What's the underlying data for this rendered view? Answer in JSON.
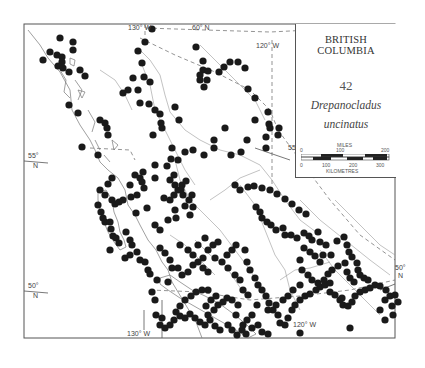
{
  "legend": {
    "region": "BRITISH COLUMBIA",
    "map_number": "42",
    "species_line1": "Drepanocladus",
    "species_line2": "uncinatus"
  },
  "scale_bar": {
    "miles_label": "MILES",
    "miles_ticks": [
      "0",
      "100",
      "200"
    ],
    "km_label": "KILOMETRES",
    "km_ticks": [
      "0",
      "100",
      "200",
      "300"
    ]
  },
  "graticule": {
    "lon_130_top": "130° W",
    "lat_60": "60° N",
    "lon_120_top": "120° W",
    "lat_55_left": "55°",
    "lat_55_left_n": "N",
    "lat_55_right": "55°",
    "lat_55_right_n": "N",
    "lat_50_left": "50°",
    "lat_50_left_n": "N",
    "lat_50_right": "50°",
    "lat_50_right_n": "N",
    "lon_130_bottom": "130° W",
    "lon_120_bottom": "120° W"
  },
  "colors": {
    "dot": "#1a1a1a",
    "line": "#777777",
    "background": "#ffffff"
  },
  "occurrence_points": [
    [
      60,
      38
    ],
    [
      73,
      42
    ],
    [
      73,
      50
    ],
    [
      50,
      52
    ],
    [
      43,
      60
    ],
    [
      57,
      55
    ],
    [
      62,
      57
    ],
    [
      62,
      62
    ],
    [
      58,
      66
    ],
    [
      63,
      68
    ],
    [
      69,
      72
    ],
    [
      80,
      70
    ],
    [
      85,
      76
    ],
    [
      69,
      105
    ],
    [
      78,
      113
    ],
    [
      100,
      120
    ],
    [
      105,
      123
    ],
    [
      107,
      128
    ],
    [
      108,
      135
    ],
    [
      82,
      147
    ],
    [
      98,
      155
    ],
    [
      152,
      29
    ],
    [
      145,
      42
    ],
    [
      138,
      51
    ],
    [
      142,
      63
    ],
    [
      133,
      78
    ],
    [
      144,
      77
    ],
    [
      150,
      82
    ],
    [
      128,
      90
    ],
    [
      138,
      90
    ],
    [
      123,
      93
    ],
    [
      140,
      103
    ],
    [
      149,
      104
    ],
    [
      155,
      110
    ],
    [
      160,
      114
    ],
    [
      161,
      123
    ],
    [
      175,
      107
    ],
    [
      179,
      120
    ],
    [
      162,
      128
    ],
    [
      153,
      135
    ],
    [
      172,
      148
    ],
    [
      171,
      159
    ],
    [
      196,
      47
    ],
    [
      203,
      61
    ],
    [
      203,
      70
    ],
    [
      208,
      71
    ],
    [
      200,
      75
    ],
    [
      200,
      80
    ],
    [
      207,
      80
    ],
    [
      204,
      87
    ],
    [
      219,
      72
    ],
    [
      224,
      67
    ],
    [
      230,
      62
    ],
    [
      238,
      62
    ],
    [
      245,
      68
    ],
    [
      248,
      89
    ],
    [
      255,
      98
    ],
    [
      225,
      128
    ],
    [
      268,
      112
    ],
    [
      269,
      124
    ],
    [
      270,
      128
    ],
    [
      266,
      137
    ],
    [
      279,
      128
    ],
    [
      278,
      135
    ],
    [
      266,
      148
    ],
    [
      255,
      120
    ],
    [
      247,
      140
    ],
    [
      241,
      152
    ],
    [
      231,
      155
    ],
    [
      204,
      155
    ],
    [
      214,
      140
    ],
    [
      214,
      148
    ],
    [
      193,
      150
    ],
    [
      185,
      152
    ],
    [
      178,
      160
    ],
    [
      167,
      166
    ],
    [
      155,
      165
    ],
    [
      143,
      172
    ],
    [
      135,
      175
    ],
    [
      140,
      178
    ],
    [
      155,
      178
    ],
    [
      170,
      180
    ],
    [
      175,
      185
    ],
    [
      178,
      190
    ],
    [
      183,
      195
    ],
    [
      192,
      195
    ],
    [
      189,
      200
    ],
    [
      193,
      207
    ],
    [
      190,
      215
    ],
    [
      185,
      206
    ],
    [
      175,
      210
    ],
    [
      176,
      218
    ],
    [
      168,
      220
    ],
    [
      160,
      230
    ],
    [
      155,
      225
    ],
    [
      164,
      198
    ],
    [
      170,
      200
    ],
    [
      174,
      195
    ],
    [
      182,
      185
    ],
    [
      181,
      190
    ],
    [
      186,
      181
    ],
    [
      174,
      175
    ],
    [
      112,
      178
    ],
    [
      108,
      184
    ],
    [
      112,
      200
    ],
    [
      115,
      204
    ],
    [
      119,
      202
    ],
    [
      123,
      200
    ],
    [
      131,
      197
    ],
    [
      137,
      195
    ],
    [
      147,
      208
    ],
    [
      144,
      188
    ],
    [
      142,
      182
    ],
    [
      105,
      195
    ],
    [
      136,
      213
    ],
    [
      130,
      185
    ],
    [
      100,
      190
    ],
    [
      98,
      205
    ],
    [
      101,
      212
    ],
    [
      103,
      218
    ],
    [
      105,
      222
    ],
    [
      110,
      222
    ],
    [
      111,
      229
    ],
    [
      113,
      236
    ],
    [
      116,
      238
    ],
    [
      119,
      243
    ],
    [
      110,
      250
    ],
    [
      235,
      185
    ],
    [
      240,
      190
    ],
    [
      248,
      187
    ],
    [
      254,
      186
    ],
    [
      262,
      188
    ],
    [
      270,
      190
    ],
    [
      277,
      194
    ],
    [
      285,
      199
    ],
    [
      292,
      204
    ],
    [
      299,
      210
    ],
    [
      306,
      214
    ],
    [
      256,
      207
    ],
    [
      260,
      212
    ],
    [
      262,
      218
    ],
    [
      267,
      222
    ],
    [
      271,
      225
    ],
    [
      276,
      230
    ],
    [
      283,
      228
    ],
    [
      285,
      235
    ],
    [
      291,
      235
    ],
    [
      297,
      238
    ],
    [
      304,
      233
    ],
    [
      309,
      236
    ],
    [
      312,
      240
    ],
    [
      318,
      232
    ],
    [
      320,
      242
    ],
    [
      323,
      255
    ],
    [
      331,
      255
    ],
    [
      326,
      245
    ],
    [
      337,
      241
    ],
    [
      344,
      237
    ],
    [
      347,
      245
    ],
    [
      349,
      252
    ],
    [
      352,
      257
    ],
    [
      357,
      263
    ],
    [
      358,
      270
    ],
    [
      360,
      275
    ],
    [
      364,
      278
    ],
    [
      368,
      280
    ],
    [
      375,
      285
    ],
    [
      380,
      286
    ],
    [
      386,
      290
    ],
    [
      390,
      296
    ],
    [
      385,
      300
    ],
    [
      380,
      310
    ],
    [
      245,
      250
    ],
    [
      247,
      262
    ],
    [
      250,
      270
    ],
    [
      255,
      278
    ],
    [
      258,
      285
    ],
    [
      262,
      290
    ],
    [
      266,
      296
    ],
    [
      269,
      303
    ],
    [
      273,
      310
    ],
    [
      278,
      315
    ],
    [
      280,
      323
    ],
    [
      285,
      325
    ],
    [
      288,
      318
    ],
    [
      292,
      310
    ],
    [
      295,
      305
    ],
    [
      300,
      300
    ],
    [
      305,
      296
    ],
    [
      310,
      294
    ],
    [
      316,
      290
    ],
    [
      320,
      287
    ],
    [
      325,
      285
    ],
    [
      330,
      283
    ],
    [
      330,
      292
    ],
    [
      335,
      295
    ],
    [
      340,
      300
    ],
    [
      343,
      305
    ],
    [
      342,
      298
    ],
    [
      348,
      306
    ],
    [
      352,
      302
    ],
    [
      355,
      296
    ],
    [
      360,
      292
    ],
    [
      365,
      290
    ],
    [
      370,
      288
    ],
    [
      300,
      260
    ],
    [
      302,
      270
    ],
    [
      308,
      275
    ],
    [
      312,
      280
    ],
    [
      318,
      283
    ],
    [
      324,
      280
    ],
    [
      328,
      274
    ],
    [
      332,
      270
    ],
    [
      338,
      266
    ],
    [
      345,
      263
    ],
    [
      347,
      272
    ],
    [
      350,
      278
    ],
    [
      354,
      282
    ],
    [
      304,
      248
    ],
    [
      310,
      252
    ],
    [
      315,
      256
    ],
    [
      320,
      262
    ],
    [
      300,
      285
    ],
    [
      293,
      290
    ],
    [
      288,
      296
    ],
    [
      283,
      300
    ],
    [
      276,
      305
    ],
    [
      268,
      310
    ],
    [
      257,
      305
    ],
    [
      252,
      315
    ],
    [
      247,
      320
    ],
    [
      243,
      325
    ],
    [
      236,
      315
    ],
    [
      238,
      305
    ],
    [
      232,
      300
    ],
    [
      227,
      298
    ],
    [
      223,
      302
    ],
    [
      218,
      305
    ],
    [
      214,
      310
    ],
    [
      208,
      315
    ],
    [
      206,
      306
    ],
    [
      211,
      300
    ],
    [
      216,
      296
    ],
    [
      208,
      290
    ],
    [
      202,
      290
    ],
    [
      196,
      292
    ],
    [
      191,
      296
    ],
    [
      185,
      300
    ],
    [
      180,
      306
    ],
    [
      176,
      312
    ],
    [
      180,
      316
    ],
    [
      185,
      318
    ],
    [
      190,
      314
    ],
    [
      195,
      318
    ],
    [
      200,
      322
    ],
    [
      205,
      325
    ],
    [
      210,
      320
    ],
    [
      215,
      326
    ],
    [
      220,
      330
    ],
    [
      228,
      325
    ],
    [
      232,
      330
    ],
    [
      237,
      335
    ],
    [
      242,
      330
    ],
    [
      246,
      334
    ],
    [
      252,
      328
    ],
    [
      258,
      325
    ],
    [
      262,
      332
    ],
    [
      268,
      334
    ],
    [
      174,
      320
    ],
    [
      170,
      325
    ],
    [
      165,
      328
    ],
    [
      160,
      325
    ],
    [
      162,
      318
    ],
    [
      156,
      315
    ],
    [
      155,
      300
    ],
    [
      152,
      292
    ],
    [
      157,
      280
    ],
    [
      168,
      282
    ],
    [
      178,
      268
    ],
    [
      182,
      275
    ],
    [
      188,
      272
    ],
    [
      193,
      265
    ],
    [
      198,
      262
    ],
    [
      203,
      268
    ],
    [
      208,
      272
    ],
    [
      215,
      258
    ],
    [
      222,
      262
    ],
    [
      228,
      268
    ],
    [
      235,
      275
    ],
    [
      240,
      280
    ],
    [
      243,
      290
    ],
    [
      248,
      295
    ],
    [
      227,
      255
    ],
    [
      232,
      250
    ],
    [
      236,
      245
    ],
    [
      126,
      232
    ],
    [
      130,
      240
    ],
    [
      132,
      245
    ],
    [
      130,
      255
    ],
    [
      125,
      258
    ],
    [
      137,
      252
    ],
    [
      140,
      260
    ],
    [
      145,
      262
    ],
    [
      148,
      270
    ],
    [
      150,
      274
    ],
    [
      208,
      250
    ],
    [
      203,
      258
    ],
    [
      213,
      245
    ],
    [
      218,
      242
    ],
    [
      165,
      253
    ],
    [
      170,
      260
    ],
    [
      172,
      268
    ],
    [
      160,
      248
    ],
    [
      180,
      245
    ],
    [
      188,
      250
    ],
    [
      193,
      255
    ],
    [
      198,
      245
    ],
    [
      205,
      238
    ],
    [
      300,
      333
    ],
    [
      350,
      328
    ],
    [
      385,
      320
    ],
    [
      393,
      315
    ],
    [
      398,
      302
    ],
    [
      395,
      295
    ],
    [
      392,
      306
    ]
  ]
}
